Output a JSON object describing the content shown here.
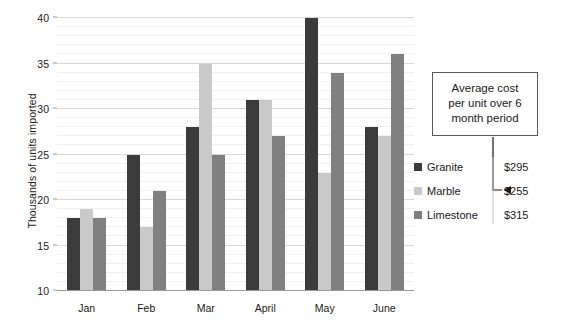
{
  "chart_data": {
    "type": "bar",
    "title": "",
    "xlabel": "",
    "ylabel": "Thousands of units imported",
    "categories": [
      "Jan",
      "Feb",
      "Mar",
      "April",
      "May",
      "June"
    ],
    "series": [
      {
        "name": "Granite",
        "color": "#3b3b3b",
        "values": [
          18,
          25,
          28,
          31,
          40,
          28
        ]
      },
      {
        "name": "Marble",
        "color": "#c9c9c9",
        "values": [
          19,
          17,
          35,
          31,
          23,
          27
        ]
      },
      {
        "name": "Limestone",
        "color": "#808080",
        "values": [
          18,
          21,
          25,
          27,
          34,
          36
        ]
      }
    ],
    "ylim": [
      10,
      40
    ],
    "ytick_step": 5,
    "yticks": [
      10,
      15,
      20,
      25,
      30,
      35,
      40
    ],
    "ytick_labels": [
      "10",
      "15",
      "20",
      "25",
      "30",
      "35",
      "40"
    ],
    "minor_gridline_step": 1,
    "grid": true,
    "legend_position": "right"
  },
  "callout": {
    "text": "Average cost per unit over 6 month period"
  },
  "legend": {
    "entries": [
      {
        "label": "Granite",
        "value": "$295",
        "color": "#3b3b3b"
      },
      {
        "label": "Marble",
        "value": "$255",
        "color": "#c9c9c9"
      },
      {
        "label": "Limestone",
        "value": "$315",
        "color": "#808080"
      }
    ]
  }
}
